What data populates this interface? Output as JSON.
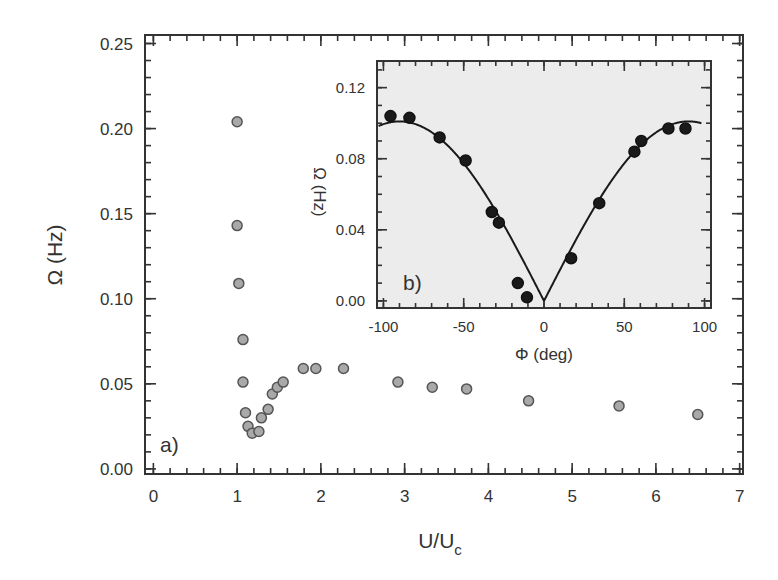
{
  "chart_data": [
    {
      "id": "a",
      "type": "scatter",
      "panel_label": "a)",
      "title": "",
      "xlabel": "U/U",
      "xlabel_subscript": "c",
      "ylabel": "Ω (Hz)",
      "xlim": [
        -0.1,
        7.04
      ],
      "ylim": [
        -0.003,
        0.255
      ],
      "xticks": [
        0,
        1,
        2,
        3,
        4,
        5,
        6,
        7
      ],
      "xtick_labels": [
        "0",
        "1",
        "2",
        "3",
        "4",
        "5",
        "6",
        "7"
      ],
      "xminor_step": 0.2,
      "yticks": [
        0.0,
        0.05,
        0.1,
        0.15,
        0.2,
        0.25
      ],
      "ytick_labels": [
        "0.00",
        "0.05",
        "0.10",
        "0.15",
        "0.20",
        "0.25"
      ],
      "yminor_step": 0.01,
      "grid": false,
      "legend": null,
      "marker": {
        "shape": "circle",
        "fill": "#a9a9a9",
        "stroke": "#555555",
        "radius": 5
      },
      "series": [
        {
          "name": "Ω vs U/Uc",
          "x": [
            1.0,
            1.0,
            1.02,
            1.07,
            1.07,
            1.1,
            1.13,
            1.18,
            1.26,
            1.29,
            1.37,
            1.42,
            1.48,
            1.55,
            1.79,
            1.94,
            2.27,
            2.92,
            3.33,
            3.74,
            4.48,
            5.56,
            6.5
          ],
          "y": [
            0.204,
            0.143,
            0.109,
            0.076,
            0.051,
            0.033,
            0.025,
            0.021,
            0.022,
            0.03,
            0.035,
            0.044,
            0.048,
            0.051,
            0.059,
            0.059,
            0.059,
            0.051,
            0.048,
            0.047,
            0.04,
            0.037,
            0.032
          ]
        }
      ]
    },
    {
      "id": "b",
      "type": "scatter",
      "inset": true,
      "panel_label": "b)",
      "title": "",
      "xlabel": "Φ (deg)",
      "ylabel": "Ω (Hz)",
      "xlim": [
        -104,
        104
      ],
      "ylim": [
        -0.004,
        0.135
      ],
      "xticks": [
        -100,
        -50,
        0,
        50,
        100
      ],
      "xtick_labels": [
        "-100",
        "-50",
        "0",
        "50",
        "100"
      ],
      "xminor_step": 10,
      "yticks": [
        0.0,
        0.04,
        0.08,
        0.12
      ],
      "ytick_labels": [
        "0.00",
        "0.04",
        "0.08",
        "0.12"
      ],
      "yminor_step": 0.01,
      "grid": false,
      "legend": null,
      "background": "#ececec",
      "marker": {
        "shape": "circle",
        "fill": "#1a1a1a",
        "stroke": "#111111",
        "radius": 5.5
      },
      "series": [
        {
          "name": "measured",
          "x": [
            -95.6,
            -83.8,
            -65.0,
            -48.8,
            -32.5,
            -28.1,
            -16.3,
            -10.6,
            16.9,
            34.4,
            56.3,
            60.6,
            77.5,
            88.1
          ],
          "y": [
            0.104,
            0.103,
            0.092,
            0.079,
            0.05,
            0.044,
            0.01,
            0.002,
            0.024,
            0.055,
            0.084,
            0.09,
            0.097,
            0.097
          ]
        },
        {
          "name": "fit",
          "type": "line",
          "function": "A*|sin(Φ)|",
          "A": 0.101,
          "x_range": [
            -103,
            98
          ]
        }
      ]
    }
  ]
}
